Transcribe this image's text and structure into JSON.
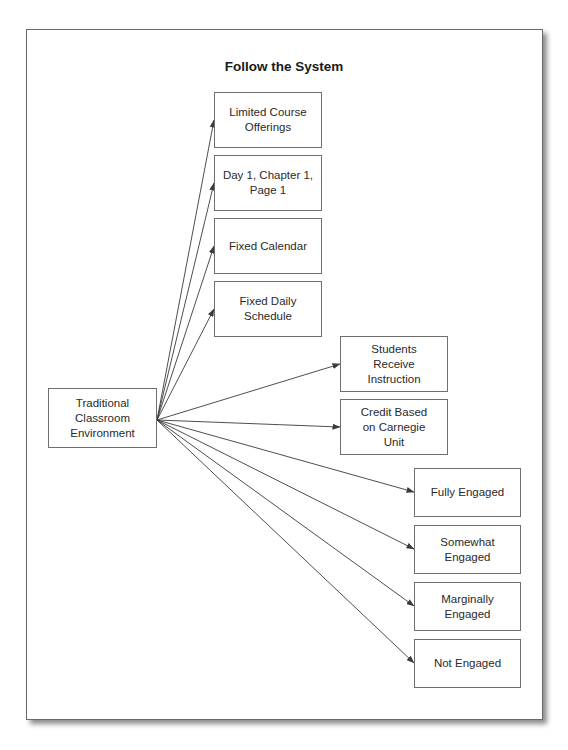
{
  "diagram": {
    "title": "Follow the System",
    "source": {
      "id": "traditional",
      "label": "Traditional\nClassroom\nEnvironment"
    },
    "targets": [
      {
        "id": "limited-course-offerings",
        "label": "Limited Course\nOfferings"
      },
      {
        "id": "day1-chapter1-page1",
        "label": "Day 1, Chapter 1,\nPage 1"
      },
      {
        "id": "fixed-calendar",
        "label": "Fixed Calendar"
      },
      {
        "id": "fixed-daily-schedule",
        "label": "Fixed Daily\nSchedule"
      },
      {
        "id": "students-receive-instruction",
        "label": "Students\nReceive\nInstruction"
      },
      {
        "id": "credit-based-carnegie",
        "label": "Credit Based\non Carnegie\nUnit"
      },
      {
        "id": "fully-engaged",
        "label": "Fully Engaged"
      },
      {
        "id": "somewhat-engaged",
        "label": "Somewhat\nEngaged"
      },
      {
        "id": "marginally-engaged",
        "label": "Marginally\nEngaged"
      },
      {
        "id": "not-engaged",
        "label": "Not Engaged"
      }
    ],
    "edges": [
      {
        "from": "traditional",
        "to": "limited-course-offerings"
      },
      {
        "from": "traditional",
        "to": "day1-chapter1-page1"
      },
      {
        "from": "traditional",
        "to": "fixed-calendar"
      },
      {
        "from": "traditional",
        "to": "fixed-daily-schedule"
      },
      {
        "from": "traditional",
        "to": "students-receive-instruction"
      },
      {
        "from": "traditional",
        "to": "credit-based-carnegie"
      },
      {
        "from": "traditional",
        "to": "fully-engaged"
      },
      {
        "from": "traditional",
        "to": "somewhat-engaged"
      },
      {
        "from": "traditional",
        "to": "marginally-engaged"
      },
      {
        "from": "traditional",
        "to": "not-engaged"
      }
    ],
    "colors": {
      "line": "#3a3a3a",
      "box_border": "#6f6f6f",
      "frame_border": "#6a6a6a"
    }
  }
}
